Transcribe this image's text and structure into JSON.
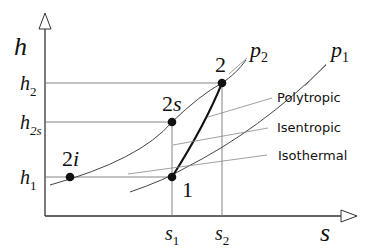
{
  "diagram": {
    "type": "h-s diagram (enthalpy-entropy)",
    "axes": {
      "y_label": "h",
      "x_label": "s"
    },
    "y_ticks": [
      {
        "id": "h2",
        "base": "h",
        "sub": "2"
      },
      {
        "id": "h2s",
        "base": "h",
        "sub": "2s"
      },
      {
        "id": "h1",
        "base": "h",
        "sub": "1"
      }
    ],
    "x_ticks": [
      {
        "id": "s1",
        "base": "s",
        "sub": "1"
      },
      {
        "id": "s2",
        "base": "s",
        "sub": "2"
      }
    ],
    "isobars": [
      {
        "id": "p2",
        "base": "p",
        "sub": "2"
      },
      {
        "id": "p1",
        "base": "p",
        "sub": "1"
      }
    ],
    "points": [
      {
        "id": "2",
        "label": "2"
      },
      {
        "id": "2s",
        "label_num": "2",
        "label_var": "s"
      },
      {
        "id": "2i",
        "label_num": "2",
        "label_var": "i"
      },
      {
        "id": "1",
        "label": "1"
      }
    ],
    "process_labels": {
      "polytropic": "Polytropic",
      "isentropic": "Isentropic",
      "isothermal": "Isothermal"
    }
  }
}
